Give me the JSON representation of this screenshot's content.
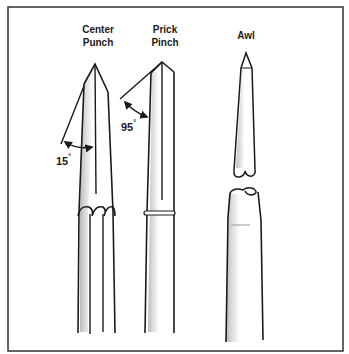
{
  "figure": {
    "tools": [
      {
        "id": "center-punch",
        "label_line1": "Center",
        "label_line2": "Punch",
        "angle_value": "15",
        "angle_unit": "°"
      },
      {
        "id": "prick-punch",
        "label_line1": "Prick",
        "label_line2": "Pinch",
        "angle_value": "95",
        "angle_unit": "°"
      },
      {
        "id": "awl",
        "label_line1": "Awl"
      }
    ],
    "colors": {
      "ink": "#1a1a1a",
      "shade": "#b8b8b8",
      "background": "#ffffff"
    }
  }
}
